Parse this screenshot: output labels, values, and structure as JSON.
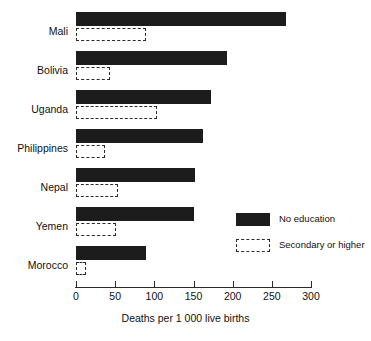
{
  "chart_data": {
    "type": "bar",
    "orientation": "horizontal",
    "title": "",
    "subtitle": "",
    "xlabel": "Deaths per 1 000 live births",
    "ylabel": "",
    "xlim": [
      0,
      300
    ],
    "xticks": [
      0,
      50,
      100,
      150,
      200,
      250,
      300
    ],
    "xtick_labels": [
      "0",
      "50",
      "100",
      "150",
      "200",
      "250",
      "300"
    ],
    "grid": false,
    "legend_position": "center-right",
    "categories": [
      "Mali",
      "Bolivia",
      "Uganda",
      "Philippines",
      "Nepal",
      "Yemen",
      "Morocco"
    ],
    "series": [
      {
        "name": "No education",
        "style": "solid-filled",
        "color": "#1c1c1c",
        "values": [
          268,
          193,
          172,
          162,
          152,
          150,
          89
        ]
      },
      {
        "name": "Secondary or higher",
        "style": "dashed-outline",
        "color": "#2a2a2a",
        "values": [
          89,
          43,
          103,
          37,
          54,
          51,
          13
        ]
      }
    ]
  },
  "axis": {
    "x_title": "Deaths per 1 000 live births",
    "tick_labels": [
      "0",
      "50",
      "100",
      "150",
      "200",
      "250",
      "300"
    ],
    "category_labels": [
      "Mali",
      "Bolivia",
      "Uganda",
      "Philippines",
      "Nepal",
      "Yemen",
      "Morocco"
    ]
  },
  "legend": {
    "items": [
      {
        "label": "No education",
        "swatch": "solid-black-rect"
      },
      {
        "label": "Secondary or higher",
        "swatch": "dashed-outline-rect"
      }
    ]
  }
}
